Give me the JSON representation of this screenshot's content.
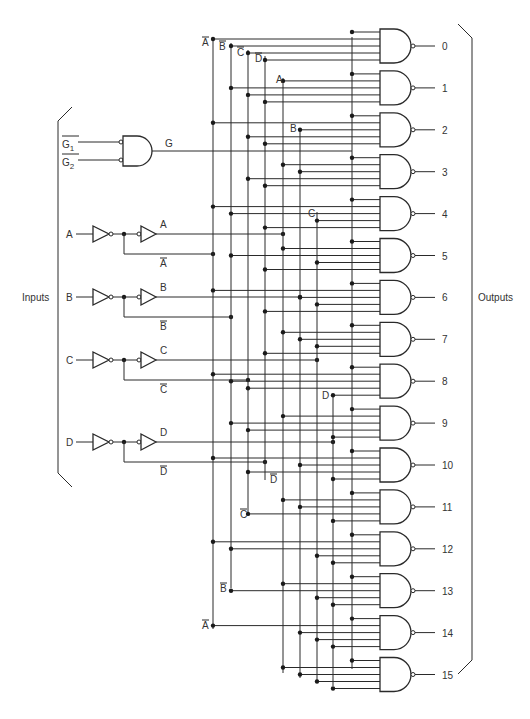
{
  "diagram": {
    "type": "4-to-16 line decoder logic diagram",
    "side_labels": {
      "inputs": "Inputs",
      "outputs": "Outputs"
    },
    "enable": {
      "inputs": [
        {
          "label": "G",
          "sub": "1",
          "inverted": true
        },
        {
          "label": "G",
          "sub": "2",
          "inverted": true
        }
      ],
      "gate": "AND (active-low inputs)",
      "output_label": "G"
    },
    "inputs": [
      {
        "name": "A",
        "true_label": "A",
        "comp_label": "A",
        "y": 234,
        "comp_y": 254
      },
      {
        "name": "B",
        "true_label": "B",
        "comp_label": "B",
        "y": 297,
        "comp_y": 317
      },
      {
        "name": "C",
        "true_label": "C",
        "comp_label": "C",
        "y": 360,
        "comp_y": 380
      },
      {
        "name": "D",
        "true_label": "D",
        "comp_label": "D",
        "y": 442,
        "comp_y": 462
      }
    ],
    "bus_labels": [
      {
        "text": "A",
        "overbar": true,
        "x": 202,
        "y": 46
      },
      {
        "text": "B",
        "overbar": true,
        "x": 219,
        "y": 50
      },
      {
        "text": "C",
        "overbar": true,
        "x": 237,
        "y": 56
      },
      {
        "text": "D",
        "overbar": true,
        "x": 255,
        "y": 62
      },
      {
        "text": "A",
        "overbar": false,
        "x": 276,
        "y": 83
      },
      {
        "text": "B",
        "overbar": false,
        "x": 290,
        "y": 132
      },
      {
        "text": "C",
        "overbar": false,
        "x": 308,
        "y": 217
      },
      {
        "text": "D",
        "overbar": false,
        "x": 322,
        "y": 399
      },
      {
        "text": "D",
        "overbar": true,
        "x": 270,
        "y": 483
      },
      {
        "text": "C",
        "overbar": true,
        "x": 240,
        "y": 518
      },
      {
        "text": "B",
        "overbar": true,
        "x": 220,
        "y": 592
      },
      {
        "text": "A",
        "overbar": true,
        "x": 202,
        "y": 629
      }
    ],
    "outputs": [
      "0",
      "1",
      "2",
      "3",
      "4",
      "5",
      "6",
      "7",
      "8",
      "9",
      "10",
      "11",
      "12",
      "13",
      "14",
      "15"
    ]
  },
  "colors": {
    "line": "#2a2a2a",
    "text": "#333333",
    "background": "#ffffff"
  }
}
